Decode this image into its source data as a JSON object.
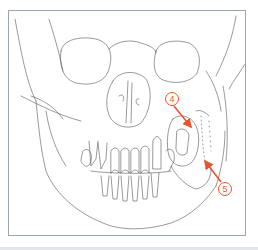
{
  "figure": {
    "line_color": "#555555",
    "frame_color": "#9aa6b8",
    "annotation_color": "#e8542f"
  },
  "annotations": [
    {
      "number": "4",
      "label_x": 171,
      "label_y": 98,
      "target_x": 192,
      "target_y": 128
    },
    {
      "number": "5",
      "label_x": 224,
      "label_y": 188,
      "target_x": 204,
      "target_y": 160
    }
  ]
}
